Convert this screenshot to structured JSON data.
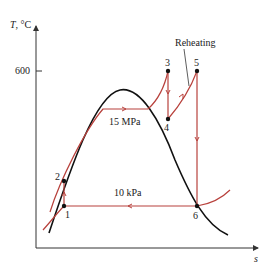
{
  "diagram": {
    "type": "T-s diagram",
    "y_axis_label": "T, °C",
    "x_axis_label": "s",
    "y_tick_label": "600",
    "annotations": {
      "reheating": "Reheating",
      "high_pressure": "15 MPa",
      "low_pressure": "10 kPa"
    },
    "states": [
      {
        "id": "1",
        "label": "1"
      },
      {
        "id": "2",
        "label": "2"
      },
      {
        "id": "3",
        "label": "3"
      },
      {
        "id": "4",
        "label": "4"
      },
      {
        "id": "5",
        "label": "5"
      },
      {
        "id": "6",
        "label": "6"
      }
    ],
    "colors": {
      "cycle": "#b8413c",
      "dome": "#111111",
      "axes": "#333333"
    }
  }
}
